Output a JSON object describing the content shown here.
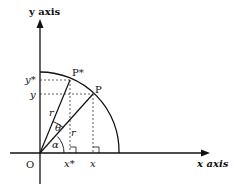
{
  "diagram": {
    "axes": {
      "x_label": "x axis",
      "y_label": "y axis",
      "origin_label": "O"
    },
    "points": {
      "P": "P",
      "P_star": "P*"
    },
    "coordinate_labels": {
      "x": "x",
      "x_star": "x*",
      "y": "y",
      "y_star": "y*"
    },
    "radius_label": "r",
    "angles": {
      "alpha": "α",
      "theta": "θ"
    },
    "colors": {
      "stroke": "#111111",
      "background": "#ffffff"
    }
  }
}
